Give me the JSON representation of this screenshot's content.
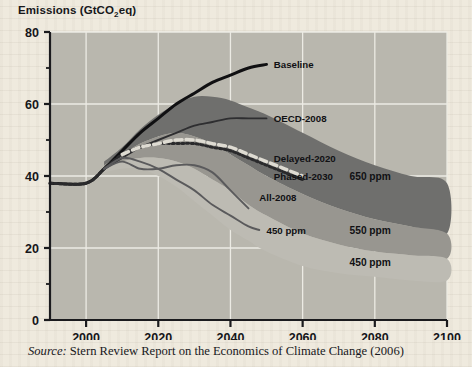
{
  "figure": {
    "axis_title": "Emissions (GtCO",
    "axis_title_sub": "2",
    "axis_title_tail": "eq)",
    "caption_source_label": "Source:",
    "caption_text": "Stern Review Report on the Economics of Climate Change (2006)"
  },
  "colors": {
    "plot_background": "#b9b7ae",
    "gridline": "#ecebe4",
    "axis": "#1b1b1e",
    "band_650": "#6f6f6d",
    "band_550": "#989690",
    "band_450": "#bdbbb3",
    "baseline_line": "#101012",
    "oecd_line": "#2e2e30",
    "delayed_line": "#2a2a2c",
    "phased_line": "#dedbd2",
    "all2008_line": "#5a5a5c",
    "p450_line": "#5a5a5c"
  },
  "chart_data": {
    "type": "area",
    "title": "Emissions (GtCO2eq)",
    "xlabel": "",
    "ylabel": "Emissions (GtCO2eq)",
    "xlim": [
      1990,
      2100
    ],
    "ylim": [
      0,
      80
    ],
    "xticks": [
      2000,
      2020,
      2040,
      2060,
      2080,
      2100
    ],
    "yticks": [
      0,
      20,
      40,
      60,
      80
    ],
    "yminorticks": [
      10,
      30,
      50,
      70
    ],
    "grid": true,
    "legend_position": "inline-annotations",
    "bands": [
      {
        "name": "650 ppm",
        "label": "650 ppm",
        "color": "#6f6f6d",
        "x": [
          2005,
          2010,
          2015,
          2020,
          2025,
          2030,
          2035,
          2040,
          2045,
          2050,
          2060,
          2070,
          2080,
          2090,
          2100
        ],
        "upper": [
          44,
          48,
          53,
          57,
          60,
          62,
          62,
          61,
          59,
          57,
          52,
          47,
          43,
          40,
          38
        ],
        "lower": [
          43,
          46,
          49,
          51,
          52,
          51,
          49,
          46,
          43,
          40,
          35,
          31,
          28,
          26,
          24
        ]
      },
      {
        "name": "550 ppm",
        "label": "550 ppm",
        "color": "#989690",
        "x": [
          2005,
          2010,
          2015,
          2020,
          2025,
          2030,
          2035,
          2040,
          2045,
          2050,
          2060,
          2070,
          2080,
          2090,
          2100
        ],
        "upper": [
          43,
          46,
          49,
          51,
          52,
          51,
          49,
          46,
          43,
          40,
          35,
          31,
          28,
          26,
          24
        ],
        "lower": [
          42,
          44,
          45,
          45,
          44,
          42,
          39,
          36,
          32,
          29,
          24,
          21,
          19,
          18,
          17
        ]
      },
      {
        "name": "450 ppm",
        "label": "450 ppm",
        "color": "#bdbbb3",
        "x": [
          2005,
          2010,
          2015,
          2020,
          2025,
          2030,
          2035,
          2040,
          2045,
          2050,
          2060,
          2070,
          2080,
          2090,
          2100
        ],
        "upper": [
          42,
          44,
          45,
          45,
          44,
          42,
          39,
          36,
          32,
          29,
          24,
          21,
          19,
          18,
          17
        ],
        "lower": [
          41,
          42,
          42,
          40,
          37,
          33,
          29,
          25,
          22,
          19,
          15,
          13,
          12,
          11,
          11
        ]
      }
    ],
    "series": [
      {
        "name": "Baseline",
        "label": "Baseline",
        "style": "solid-thick",
        "color": "#101012",
        "x": [
          1990,
          2000,
          2005,
          2010,
          2015,
          2020,
          2025,
          2030,
          2035,
          2040,
          2045,
          2050
        ],
        "values": [
          38,
          38,
          42,
          47,
          52,
          56,
          60,
          63,
          66,
          68,
          70,
          71
        ]
      },
      {
        "name": "OECD-2008",
        "label": "OECD-2008",
        "style": "solid",
        "color": "#2e2e30",
        "x": [
          2005,
          2010,
          2015,
          2020,
          2025,
          2030,
          2035,
          2040,
          2045,
          2050
        ],
        "values": [
          42,
          45,
          48,
          50,
          52,
          54,
          55,
          56,
          56,
          56
        ]
      },
      {
        "name": "Delayed-2020",
        "label": "Delayed-2020",
        "style": "dotted",
        "color": "#2a2a2c",
        "x": [
          1990,
          2000,
          2005,
          2010,
          2015,
          2020,
          2025,
          2030,
          2035,
          2040,
          2045,
          2050,
          2055,
          2060
        ],
        "values": [
          38,
          38,
          42,
          46,
          48,
          49,
          49,
          49,
          48,
          47,
          45,
          43,
          41,
          39
        ]
      },
      {
        "name": "Phased-2030",
        "label": "Phased-2030",
        "style": "dashed",
        "color": "#dedbd2",
        "x": [
          2010,
          2015,
          2020,
          2025,
          2030,
          2035,
          2040,
          2045,
          2050,
          2055,
          2060
        ],
        "values": [
          46,
          48,
          49,
          50,
          50,
          49,
          48,
          46,
          44,
          42,
          40
        ]
      },
      {
        "name": "All-2008",
        "label": "All-2008",
        "style": "solid",
        "color": "#5a5a5c",
        "x": [
          2005,
          2010,
          2015,
          2020,
          2025,
          2030,
          2035,
          2040,
          2045
        ],
        "values": [
          42,
          44,
          42,
          42,
          43,
          43,
          41,
          36,
          31
        ]
      },
      {
        "name": "450 ppm",
        "label": "450 ppm",
        "style": "solid",
        "color": "#5a5a5c",
        "x": [
          2005,
          2010,
          2015,
          2020,
          2025,
          2030,
          2035,
          2040,
          2045,
          2048
        ],
        "values": [
          42,
          45,
          44,
          42,
          39,
          36,
          32,
          29,
          26,
          25
        ]
      }
    ],
    "annotations": [
      {
        "text": "Baseline",
        "x": 2052,
        "y": 71
      },
      {
        "text": "OECD-2008",
        "x": 2052,
        "y": 56
      },
      {
        "text": "Delayed-2020",
        "x": 2052,
        "y": 45
      },
      {
        "text": "Phased-2030",
        "x": 2052,
        "y": 40
      },
      {
        "text": "All-2008",
        "x": 2048,
        "y": 34
      },
      {
        "text": "450 ppm",
        "x": 2050,
        "y": 25
      },
      {
        "text": "650 ppm",
        "x": 2073,
        "y": 40
      },
      {
        "text": "550 ppm",
        "x": 2073,
        "y": 25
      },
      {
        "text": "450 ppm",
        "x": 2073,
        "y": 16
      }
    ]
  }
}
